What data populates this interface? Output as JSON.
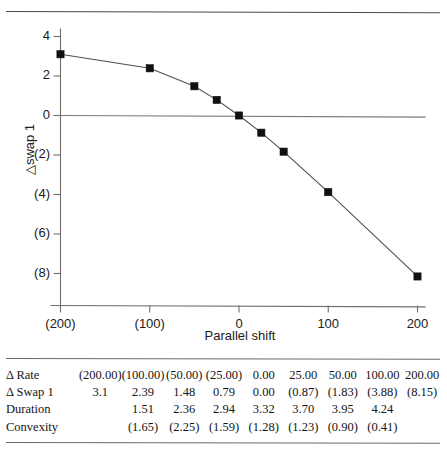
{
  "chart_data": {
    "type": "line",
    "title": "",
    "xlabel": "Parallel shift",
    "ylabel": "△swap 1",
    "x": [
      -200,
      -100,
      -50,
      -25,
      0,
      25,
      50,
      100,
      200
    ],
    "values": [
      3.1,
      2.39,
      1.48,
      0.79,
      0.0,
      -0.87,
      -1.83,
      -3.88,
      -8.15
    ],
    "xlim": [
      -200,
      200
    ],
    "ylim": [
      -9,
      4.6
    ],
    "xticks": [
      -200,
      -100,
      0,
      100,
      200
    ],
    "xtick_labels": [
      "(200)",
      "(100)",
      "0",
      "100",
      "200"
    ],
    "yticks": [
      4,
      2,
      0,
      -2,
      -4,
      -6,
      -8
    ],
    "ytick_labels": [
      "4",
      "2",
      "0",
      "(2)",
      "(4)",
      "(6)",
      "(8)"
    ],
    "grid": false,
    "legend": "none",
    "marker": "square",
    "marker_color": "#101010",
    "line_color": "#4f4f4f",
    "zero_line": true,
    "series": [
      {
        "name": "△swap 1",
        "values": [
          3.1,
          2.39,
          1.48,
          0.79,
          0.0,
          -0.87,
          -1.83,
          -3.88,
          -8.15
        ]
      }
    ]
  },
  "table": {
    "rows": [
      {
        "label": "Δ Rate",
        "cells": [
          "(200.00)",
          "(100.00)",
          "(50.00)",
          "(25.00)",
          "0.00",
          "25.00",
          "50.00",
          "100.00",
          "200.00"
        ]
      },
      {
        "label": "Δ Swap 1",
        "cells": [
          "3.1",
          "2.39",
          "1.48",
          "0.79",
          "0.00",
          "(0.87)",
          "(1.83)",
          "(3.88)",
          "(8.15)"
        ]
      },
      {
        "label": "Duration",
        "cells": [
          "",
          "1.51",
          "2.36",
          "2.94",
          "3.32",
          "3.70",
          "3.95",
          "4.24",
          ""
        ]
      },
      {
        "label": "Convexity",
        "cells": [
          "",
          "(1.65)",
          "(2.25)",
          "(1.59)",
          "(1.28)",
          "(1.23)",
          "(0.90)",
          "(0.41)",
          ""
        ]
      }
    ]
  }
}
